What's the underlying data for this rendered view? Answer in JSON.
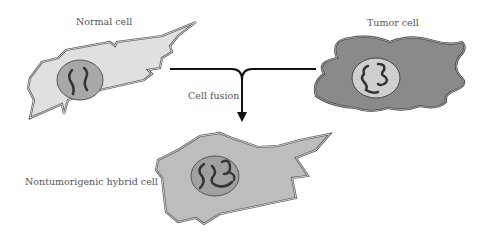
{
  "diagram": {
    "labels": {
      "normal_cell": "Normal cell",
      "tumor_cell": "Tumor cell",
      "fusion": "Cell fusion",
      "hybrid_cell": "Nontumorigenic hybrid cell"
    },
    "colors": {
      "normal_cytoplasm": "#e0e0e0",
      "tumor_cytoplasm": "#8a8a8a",
      "hybrid_cytoplasm": "#bdbdbd",
      "nucleus_normal": "#a8a8a8",
      "nucleus_tumor": "#cfcfcf",
      "chromosome": "#333333",
      "arrow": "#111111"
    }
  }
}
